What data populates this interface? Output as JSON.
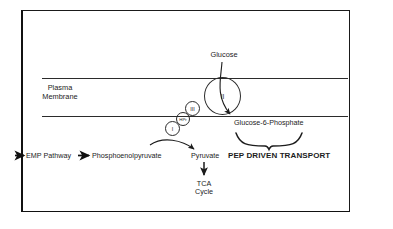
{
  "figure": {
    "frame": {
      "border_color": "#111111"
    },
    "membrane": {
      "label_line1": "Plasma",
      "label_line2": "Membrane",
      "line_color": "#2b2b2b"
    },
    "labels": {
      "glucose": "Glucose",
      "glucose_6_phosphate": "Glucose-6-Phosphate",
      "emp_pathway": "EMP Pathway",
      "phosphoenolpyruvate": "Phosphoenolpyruvate",
      "pyruvate": "Pyruvate",
      "pep_driven_transport": "PEP DRIVEN TRANSPORT",
      "tca_line1": "TCA",
      "tca_line2": "Cycle"
    },
    "proteins": [
      {
        "name": "enzyme-ii",
        "label": "II"
      },
      {
        "name": "enzyme-iii",
        "label": "III"
      },
      {
        "name": "hpr-carrier",
        "label": "HPr"
      },
      {
        "name": "enzyme-i",
        "label": "I"
      }
    ],
    "colors": {
      "ink": "#1c1c1c",
      "line": "#2b2b2b",
      "background": "#ffffff"
    }
  }
}
